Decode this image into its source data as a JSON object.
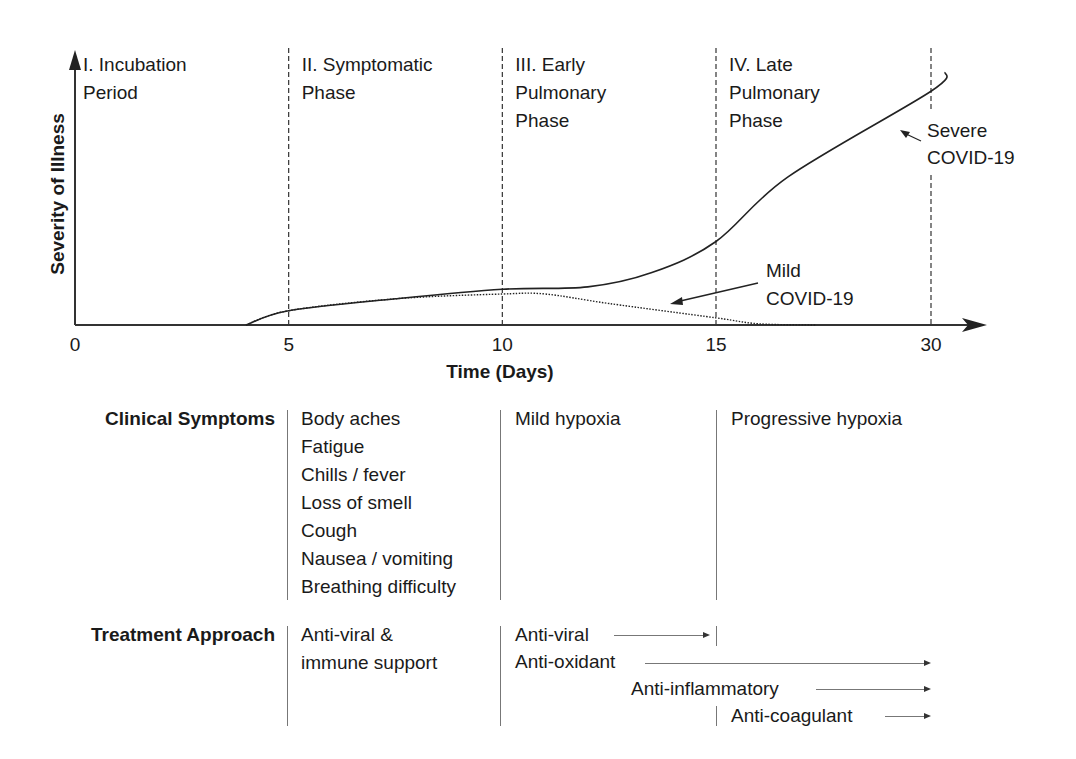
{
  "chart_data": {
    "type": "line",
    "title": "",
    "xlabel": "Time (Days)",
    "ylabel": "Severity of Illness",
    "x_ticks": [
      "0",
      "5",
      "10",
      "15",
      "30"
    ],
    "x_tick_values": [
      0,
      5,
      10,
      15,
      30
    ],
    "x_scale_note": "non-linear axis: 0,5,10,15 equally spaced then break to 30",
    "phases": [
      {
        "label_lines": [
          "I. Incubation",
          "Period"
        ],
        "start": 0,
        "end": 5
      },
      {
        "label_lines": [
          "II. Symptomatic",
          "Phase"
        ],
        "start": 5,
        "end": 10
      },
      {
        "label_lines": [
          "III. Early",
          "Pulmonary",
          "Phase"
        ],
        "start": 10,
        "end": 15
      },
      {
        "label_lines": [
          "IV. Late",
          "Pulmonary",
          "Phase"
        ],
        "start": 15,
        "end": 30
      }
    ],
    "series": [
      {
        "name": "Severe COVID-19",
        "style": "solid",
        "points": [
          [
            4,
            0
          ],
          [
            5,
            0.06
          ],
          [
            7.5,
            0.11
          ],
          [
            10,
            0.15
          ],
          [
            12,
            0.16
          ],
          [
            13.5,
            0.22
          ],
          [
            15,
            0.35
          ],
          [
            20,
            0.62
          ],
          [
            30,
            0.98
          ],
          [
            31,
            1.06
          ]
        ]
      },
      {
        "name": "Mild COVID-19",
        "style": "dotted",
        "points": [
          [
            4,
            0
          ],
          [
            5,
            0.06
          ],
          [
            7.5,
            0.11
          ],
          [
            10,
            0.13
          ],
          [
            11,
            0.13
          ],
          [
            12.5,
            0.09
          ],
          [
            15,
            0.03
          ],
          [
            18,
            0.005
          ],
          [
            22,
            0
          ]
        ]
      }
    ],
    "annotations": [
      {
        "text_lines": [
          "Severe",
          "COVID-19"
        ],
        "points_to": "Severe COVID-19"
      },
      {
        "text_lines": [
          "Mild",
          "COVID-19"
        ],
        "points_to": "Mild COVID-19"
      }
    ],
    "ylim": [
      0,
      1.1
    ],
    "grid": false,
    "legend": "none"
  },
  "table": {
    "rows": [
      {
        "header": "Clinical Symptoms",
        "cells": [
          {
            "phase": "II",
            "lines": [
              "Body aches",
              "Fatigue",
              "Chills / fever",
              "Loss of smell",
              "Cough",
              "Nausea / vomiting",
              "Breathing difficulty"
            ]
          },
          {
            "phase": "III",
            "lines": [
              "Mild hypoxia"
            ]
          },
          {
            "phase": "IV",
            "lines": [
              "Progressive hypoxia"
            ]
          }
        ]
      },
      {
        "header": "Treatment Approach",
        "cells": [
          {
            "phase": "II",
            "lines": [
              "Anti-viral &",
              "immune support"
            ]
          }
        ],
        "treatments": [
          {
            "label": "Anti-viral",
            "from_day": 10,
            "to_day": 15
          },
          {
            "label": "Anti-oxidant",
            "from_day": 10,
            "to_day": 30
          },
          {
            "label": "Anti-inflammatory",
            "from_day": 12.5,
            "to_day": 30
          },
          {
            "label": "Anti-coagulant",
            "from_day": 15,
            "to_day": 30
          }
        ]
      }
    ]
  }
}
